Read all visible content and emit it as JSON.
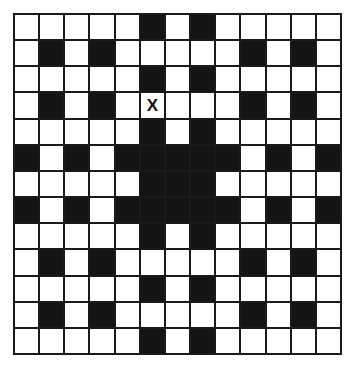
{
  "puzzle": {
    "type": "crossword-grid",
    "rows": 13,
    "cols": 13,
    "colors": {
      "black_cell": "#141414",
      "white_cell": "#ffffff",
      "grid_line": "#1a1a1a",
      "mark_text": "#111111"
    },
    "black_cells": [
      [
        5,
        7
      ],
      [
        1,
        3,
        9,
        11
      ],
      [
        5,
        7
      ],
      [
        1,
        3,
        9,
        11
      ],
      [
        5,
        7
      ],
      [
        0,
        2,
        4,
        5,
        6,
        7,
        8,
        10,
        12
      ],
      [
        5,
        6,
        7
      ],
      [
        0,
        2,
        4,
        5,
        6,
        7,
        8,
        10,
        12
      ],
      [
        5,
        7
      ],
      [
        1,
        3,
        9,
        11
      ],
      [
        5,
        7
      ],
      [
        1,
        3,
        9,
        11
      ],
      [
        5,
        7
      ]
    ],
    "marks": [
      {
        "row": 3,
        "col": 5,
        "text": "X"
      }
    ]
  }
}
